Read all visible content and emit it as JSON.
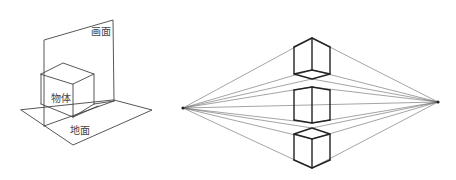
{
  "left_figure": {
    "labels": {
      "picture_plane": "画面",
      "object": "物体",
      "ground_plane": "地面"
    }
  },
  "right_figure": {
    "description": "two-point perspective: three cubes above, on and below the horizon line with converging lines to two vanishing points"
  },
  "colors": {
    "line": "#333333",
    "thin_line": "#555555",
    "text": "#444444",
    "background": "#ffffff"
  }
}
